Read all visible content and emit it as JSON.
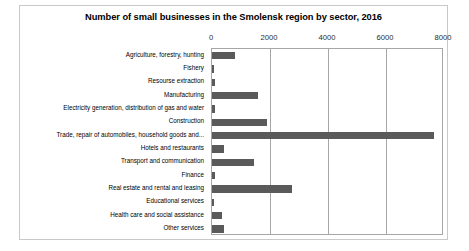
{
  "chart_data": {
    "type": "bar",
    "orientation": "horizontal",
    "title": "Number of small businesses in the Smolensk region by sector, 2016",
    "xlabel": "",
    "ylabel": "",
    "xlim": [
      0,
      8000
    ],
    "xticks": [
      0,
      2000,
      4000,
      6000,
      8000
    ],
    "xtick_labels": [
      "0",
      "2000",
      "4000",
      "6000",
      "8000"
    ],
    "grid": true,
    "legend": false,
    "axis_position": "top",
    "bar_color": "#5a5a5a",
    "categories": [
      "Agriculture, forestry, hunting",
      "Fishery",
      "Resourse extraction",
      "Manufacturing",
      "Electricity generation, distribution of gas and water",
      "Construction",
      "Trade, repair of automobiles, household goods and...",
      "Hotels and restaurants",
      "Transport and communication",
      "Finance",
      "Real estate and rental and leasing",
      "Educational services",
      "Health care and social assistance",
      "Other services"
    ],
    "values": [
      800,
      80,
      100,
      1600,
      110,
      1900,
      7650,
      420,
      1450,
      120,
      2750,
      80,
      330,
      430
    ]
  }
}
